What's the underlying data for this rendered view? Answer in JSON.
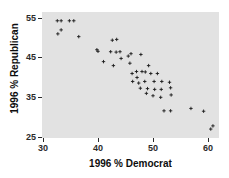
{
  "chart_data": {
    "type": "scatter",
    "title": "",
    "xlabel": "1996 % Democrat",
    "ylabel": "1996 % Republican",
    "xlim": [
      28,
      62
    ],
    "ylim": [
      24,
      56
    ],
    "xticks": [
      30,
      40,
      50,
      60
    ],
    "yticks": [
      25,
      35,
      45,
      55
    ],
    "grid": false,
    "legend": null,
    "marker": "plus",
    "marker_color": "#1a1a1a",
    "panel_color": "#e2e2e2",
    "points": [
      {
        "x": 32.6,
        "y": 54.3
      },
      {
        "x": 33.3,
        "y": 54.3
      },
      {
        "x": 34.8,
        "y": 54.3
      },
      {
        "x": 35.6,
        "y": 54.3
      },
      {
        "x": 32.7,
        "y": 51.0
      },
      {
        "x": 33.3,
        "y": 52.0
      },
      {
        "x": 36.5,
        "y": 50.3
      },
      {
        "x": 39.8,
        "y": 47.0
      },
      {
        "x": 40.0,
        "y": 46.6
      },
      {
        "x": 41.0,
        "y": 44.0
      },
      {
        "x": 42.6,
        "y": 49.4
      },
      {
        "x": 43.4,
        "y": 49.6
      },
      {
        "x": 42.3,
        "y": 46.5
      },
      {
        "x": 43.3,
        "y": 46.4
      },
      {
        "x": 44.0,
        "y": 46.5
      },
      {
        "x": 45.5,
        "y": 45.4
      },
      {
        "x": 46.0,
        "y": 46.0
      },
      {
        "x": 42.8,
        "y": 43.0
      },
      {
        "x": 45.8,
        "y": 43.6
      },
      {
        "x": 47.8,
        "y": 45.8
      },
      {
        "x": 46.2,
        "y": 41.0
      },
      {
        "x": 47.0,
        "y": 41.5
      },
      {
        "x": 48.0,
        "y": 41.5
      },
      {
        "x": 48.6,
        "y": 41.4
      },
      {
        "x": 47.1,
        "y": 40.0
      },
      {
        "x": 49.6,
        "y": 41.0
      },
      {
        "x": 46.3,
        "y": 39.0
      },
      {
        "x": 47.4,
        "y": 38.6
      },
      {
        "x": 48.5,
        "y": 39.0
      },
      {
        "x": 50.2,
        "y": 39.0
      },
      {
        "x": 51.6,
        "y": 39.0
      },
      {
        "x": 53.0,
        "y": 38.8
      },
      {
        "x": 47.7,
        "y": 37.3
      },
      {
        "x": 49.0,
        "y": 37.2
      },
      {
        "x": 50.3,
        "y": 37.0
      },
      {
        "x": 51.5,
        "y": 37.0
      },
      {
        "x": 53.2,
        "y": 37.4
      },
      {
        "x": 48.8,
        "y": 36.0
      },
      {
        "x": 50.0,
        "y": 35.4
      },
      {
        "x": 51.4,
        "y": 35.0
      },
      {
        "x": 53.3,
        "y": 35.6
      },
      {
        "x": 52.0,
        "y": 31.6
      },
      {
        "x": 53.2,
        "y": 31.6
      },
      {
        "x": 56.9,
        "y": 32.2
      },
      {
        "x": 59.2,
        "y": 31.5
      },
      {
        "x": 60.5,
        "y": 27.0
      },
      {
        "x": 60.9,
        "y": 27.8
      },
      {
        "x": 44.2,
        "y": 44.8
      },
      {
        "x": 49.2,
        "y": 43.0
      },
      {
        "x": 50.8,
        "y": 41.0
      }
    ]
  },
  "axes": {
    "x_tick_labels": [
      "30",
      "40",
      "50",
      "60"
    ],
    "y_tick_labels": [
      "25",
      "35",
      "45",
      "55"
    ],
    "x_title": "1996 % Democrat",
    "y_title": "1996 % Republican"
  }
}
